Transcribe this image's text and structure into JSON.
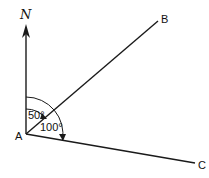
{
  "diagram": {
    "type": "bearing-geometry",
    "north_label": "N",
    "points": {
      "A": {
        "label": "A"
      },
      "B": {
        "label": "B"
      },
      "C": {
        "label": "C"
      }
    },
    "angles": [
      {
        "label": "50°",
        "from": "North",
        "to": "AB"
      },
      {
        "label": "100°",
        "from": "North",
        "to": "AC"
      }
    ],
    "colors": {
      "line": "#1a1a1a",
      "background": "#ffffff"
    }
  }
}
